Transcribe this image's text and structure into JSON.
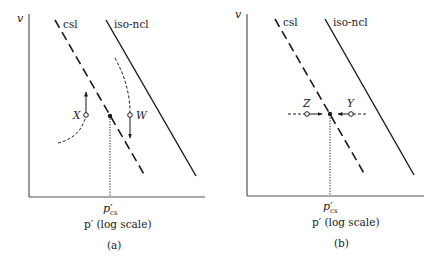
{
  "colors": {
    "ink": "#1a1a1a",
    "axis": "#555555",
    "background": "#ffffff"
  },
  "panels": [
    {
      "id": "a",
      "caption": "(a)",
      "y_axis_label": "v",
      "x_axis_label": "p′ (log scale)",
      "x_tick_label_main": "p′",
      "x_tick_label_sub": "cs",
      "lines": {
        "csl_label": "csl",
        "ncl_label": "iso-ncl"
      },
      "points": [
        {
          "label": "X",
          "type": "open",
          "path": "dashed curve from below-left, arrow upward"
        },
        {
          "label": "W",
          "type": "open",
          "path": "dashed curve from above, arrow downward"
        }
      ]
    },
    {
      "id": "b",
      "caption": "(b)",
      "y_axis_label": "v",
      "x_axis_label": "p′ (log scale)",
      "x_tick_label_main": "p′",
      "x_tick_label_sub": "cs",
      "lines": {
        "csl_label": "csl",
        "ncl_label": "iso-ncl"
      },
      "points": [
        {
          "label": "Z",
          "type": "open",
          "path": "horizontal dashed, arrow rightward to csl"
        },
        {
          "label": "Y",
          "type": "open",
          "path": "horizontal dashed, arrow leftward to csl"
        }
      ]
    }
  ]
}
